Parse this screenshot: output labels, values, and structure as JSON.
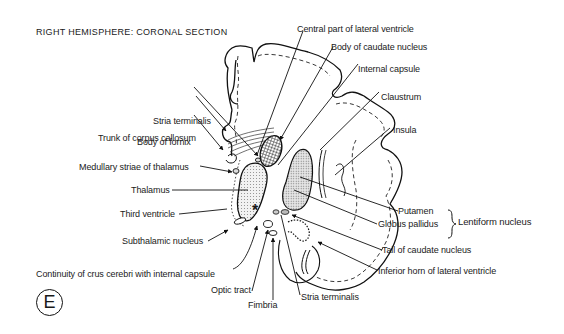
{
  "title": "RIGHT HEMISPHERE: CORONAL SECTION",
  "panel_label": "E",
  "labels": {
    "central_part_lateral_ventricle": "Central part of lateral ventricle",
    "body_caudate_nucleus": "Body of caudate nucleus",
    "internal_capsule": "Internal capsule",
    "claustrum": "Claustrum",
    "insula": "Insula",
    "stria_terminalis_top": "Stria terminalis",
    "trunk_corpus_callosum": "Trunk of corpus callosum",
    "body_of_fornix": "Body of fornix",
    "medullary_striae_thalamus": "Medullary striae of thalamus",
    "thalamus": "Thalamus",
    "third_ventricle": "Third ventricle",
    "subthalamic_nucleus": "Subthalamic nucleus",
    "putamen": "Putamen",
    "globus_pallidus": "Globus pallidus",
    "lentiform_nucleus": "Lentiform nucleus",
    "tail_caudate_nucleus": "Tail of caudate nucleus",
    "inferior_horn_lateral_ventricle": "Inferior horn of lateral ventricle",
    "continuity_crus_cerebri": "Continuity of crus cerebri with internal capsule",
    "optic_tract": "Optic tract",
    "fimbria": "Fimbria",
    "stria_terminalis_bottom": "Stria terminalis",
    "asterisk": "*"
  }
}
